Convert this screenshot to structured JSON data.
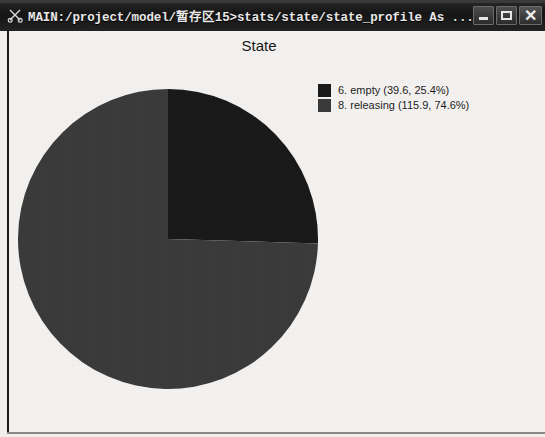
{
  "window": {
    "title": "MAIN:/project/model/暂存区15>stats/state/state_profile As ...",
    "app_icon": "scissors-icon",
    "buttons": {
      "minimize": "minimize-button",
      "maximize": "maximize-button",
      "close": "close-button",
      "minimize_glyph": "",
      "maximize_glyph": "",
      "close_glyph": "✕"
    }
  },
  "chart_data": {
    "type": "pie",
    "title": "State",
    "xlabel": "",
    "ylabel": "",
    "categories": [
      "6. empty",
      "8. releasing"
    ],
    "values": [
      39.6,
      115.9
    ],
    "percents": [
      25.4,
      74.6
    ],
    "colors": [
      "#1a1a1a",
      "#3b3b3b"
    ],
    "legend_position": "top-right",
    "grid": false,
    "start_angle_deg": 0,
    "direction": "clockwise",
    "legend": [
      {
        "label": "6. empty (39.6, 25.4%)",
        "name": "6. empty",
        "value": 39.6,
        "percent": 25.4,
        "color": "#1a1a1a"
      },
      {
        "label": "8. releasing (115.9, 74.6%)",
        "name": "8. releasing",
        "value": 115.9,
        "percent": 74.6,
        "color": "#3b3b3b"
      }
    ]
  }
}
